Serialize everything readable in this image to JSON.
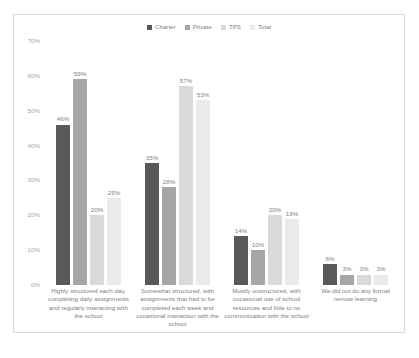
{
  "chart_data": {
    "type": "bar",
    "title": "",
    "xlabel": "",
    "ylabel": "",
    "ylim": [
      0,
      70
    ],
    "grid": false,
    "legend_position": "top-center",
    "y_ticks": [
      "0%",
      "10%",
      "20%",
      "30%",
      "40%",
      "50%",
      "60%",
      "70%"
    ],
    "categories": [
      "Highly structured each day, completing daily assignments and regularly interacting with the school",
      "Somewhat structured, with assignments that had to be completed each week and occasional interaction with the school",
      "Mostly unstructured, with occasional use of school resources and little to no communication with the school",
      "We did not do any formal remote learning"
    ],
    "series": [
      {
        "name": "Charter",
        "color": "#595959",
        "values": [
          46,
          35,
          14,
          6
        ],
        "labels": [
          "46%",
          "35%",
          "14%",
          "6%"
        ]
      },
      {
        "name": "Private",
        "color": "#a6a6a6",
        "values": [
          59,
          28,
          10,
          3
        ],
        "labels": [
          "59%",
          "28%",
          "10%",
          "3%"
        ]
      },
      {
        "name": "TPS",
        "color": "#d9d9d9",
        "values": [
          20,
          57,
          20,
          3
        ],
        "labels": [
          "20%",
          "57%",
          "20%",
          "3%"
        ]
      },
      {
        "name": "Total",
        "color": "#eaeaea",
        "values": [
          25,
          53,
          19,
          3
        ],
        "labels": [
          "25%",
          "53%",
          "19%",
          "3%"
        ]
      }
    ]
  },
  "legend": {
    "items": [
      {
        "label": "Charter",
        "color": "#595959"
      },
      {
        "label": "Private",
        "color": "#a6a6a6"
      },
      {
        "label": "TPS",
        "color": "#d9d9d9"
      },
      {
        "label": "Total",
        "color": "#eaeaea"
      }
    ]
  }
}
